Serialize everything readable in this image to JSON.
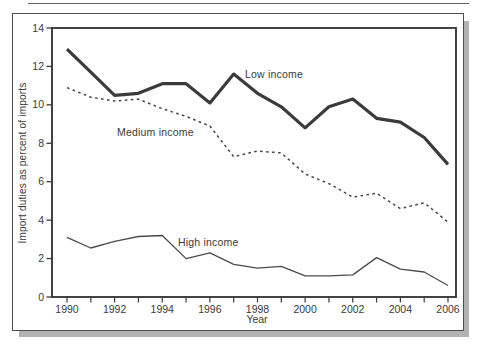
{
  "page": {
    "background": "#ffffff"
  },
  "chart_data": {
    "type": "line",
    "title": "",
    "xlabel": "Year",
    "ylabel": "Import duties as percent of imports",
    "x": [
      1990,
      1991,
      1992,
      1993,
      1994,
      1995,
      1996,
      1997,
      1998,
      1999,
      2000,
      2001,
      2002,
      2003,
      2004,
      2005,
      2006
    ],
    "series": [
      {
        "name": "Low income",
        "style": "thick-solid",
        "values": [
          12.9,
          11.7,
          10.5,
          10.6,
          11.1,
          11.1,
          10.1,
          11.6,
          10.6,
          9.9,
          8.8,
          9.9,
          10.3,
          9.3,
          9.1,
          8.3,
          6.9
        ]
      },
      {
        "name": "Medium income",
        "style": "dashed",
        "values": [
          10.9,
          10.4,
          10.2,
          10.3,
          9.8,
          9.4,
          8.9,
          7.3,
          7.6,
          7.5,
          6.4,
          5.9,
          5.2,
          5.4,
          4.6,
          4.9,
          3.9
        ]
      },
      {
        "name": "High income",
        "style": "thin-solid",
        "values": [
          3.1,
          2.55,
          2.9,
          3.15,
          3.2,
          2.0,
          2.3,
          1.7,
          1.5,
          1.6,
          1.1,
          1.1,
          1.15,
          2.05,
          1.45,
          1.3,
          0.6
        ]
      }
    ],
    "x_tick_labels": [
      "1990",
      "1992",
      "1994",
      "1996",
      "1998",
      "2000",
      "2002",
      "2004",
      "2006"
    ],
    "x_minor_tick_every_year": true,
    "y_ticks": [
      0,
      2,
      4,
      6,
      8,
      10,
      12,
      14
    ],
    "xlim": [
      1990,
      2006
    ],
    "ylim": [
      0,
      14
    ],
    "grid": false,
    "legend": "inline-labels",
    "annotations": [
      {
        "text": "Low income"
      },
      {
        "text": "Medium income"
      },
      {
        "text": "High income"
      }
    ],
    "colors": {
      "line_thick": "#3b3b3b",
      "line_dashed": "#464646",
      "line_thin": "#4c4c4c",
      "axis": "#3a3a3a",
      "text": "#3a3a3a",
      "frame": "#4e4e4e",
      "shadow": "#b2b2b2",
      "background": "#ffffff"
    }
  }
}
